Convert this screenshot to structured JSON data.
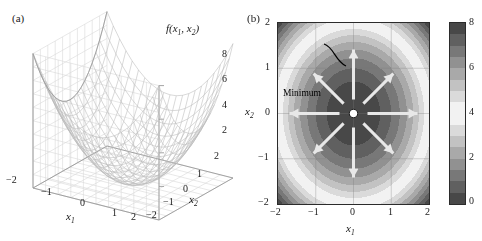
{
  "figure": {
    "panel_a_label": "(a)",
    "panel_b_label": "(b)"
  },
  "chart_data": [
    {
      "type": "surface",
      "panel": "(a)",
      "title": "",
      "zlabel": "f(x1, x2)",
      "zlabel_display": "f(x₁, x₂)",
      "xlabel": "x1",
      "xlabel_display": "x₁",
      "ylabel": "x2",
      "ylabel_display": "x₂",
      "function": "f(x1,x2) = x1^2 + x2^2",
      "xlim": [
        -2,
        2
      ],
      "ylim": [
        -2,
        2
      ],
      "zlim": [
        0,
        8
      ],
      "xticks": [
        -2,
        -1,
        0,
        1,
        2
      ],
      "yticks": [
        -2,
        -1,
        0,
        1,
        2
      ],
      "zticks": [
        2,
        4,
        6,
        8
      ],
      "xtick_labels": [
        "-2",
        "-1",
        "0",
        "1",
        "2"
      ],
      "ytick_labels": [
        "2",
        "1",
        "0",
        "-1",
        "-2"
      ],
      "ztick_labels": [
        "2",
        "4",
        "6",
        "8"
      ],
      "grid": true,
      "mesh_color": "#b9b9b9",
      "mesh_n": 21,
      "legend": "none"
    },
    {
      "type": "heatmap",
      "panel": "(b)",
      "title": "",
      "xlabel": "x1",
      "xlabel_display": "x₁",
      "ylabel": "x2",
      "ylabel_display": "x₂",
      "function": "f(x1,x2) = x1^2 + x2^2",
      "xlim": [
        -2,
        2
      ],
      "ylim": [
        -2,
        2
      ],
      "xticks": [
        -2,
        -1,
        0,
        1,
        2
      ],
      "yticks": [
        -2,
        -1,
        0,
        1,
        2
      ],
      "xtick_labels": [
        "-2",
        "-1",
        "0",
        "1",
        "2"
      ],
      "ytick_labels": [
        "2",
        "1",
        "0",
        "-1",
        "-2"
      ],
      "grid": true,
      "colorbar": {
        "vmin": 0,
        "vmax": 8,
        "ticks": [
          0,
          2,
          4,
          6,
          8
        ],
        "tick_labels": [
          "0",
          "2",
          "4",
          "6",
          "8"
        ],
        "position": "right",
        "colormap": "dark-light-dark cyclic gray"
      },
      "annotations": [
        {
          "label": "Minimum",
          "point": [
            0,
            0
          ],
          "marker": "white-filled-circle"
        }
      ],
      "arrows": {
        "color": "#e8e8e8",
        "origin": [
          0,
          0
        ],
        "count": 8,
        "directions_deg": [
          0,
          45,
          90,
          135,
          180,
          225,
          270,
          315
        ]
      }
    }
  ]
}
